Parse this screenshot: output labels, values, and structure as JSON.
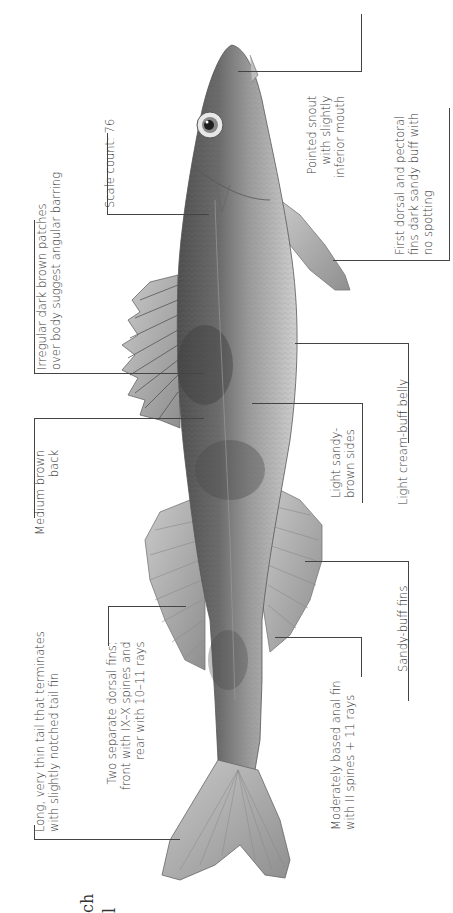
{
  "figure": {
    "orientation": "rotated 90 degrees counter-clockwise",
    "title_fragment": [
      "ch",
      "l"
    ]
  },
  "labels": {
    "tail": [
      "Long, very thin tail that terminates",
      "with slightly notched tail fin"
    ],
    "dorsal_fins": [
      "Two separate dorsal fins;",
      "front with IX–X spines and",
      "rear with 10–11 rays"
    ],
    "back": [
      "Medium brown",
      "back"
    ],
    "patches": [
      "Irregular dark brown patches",
      "over body suggest angular barring"
    ],
    "scale_count": [
      "Scale count: 76"
    ],
    "snout": [
      "Pointed snout",
      "with slightly",
      "inferior mouth"
    ],
    "pectoral": [
      "First dorsal and pectoral",
      "fins dark sandy buff with",
      "no spotting"
    ],
    "belly": [
      "Light cream-buff belly"
    ],
    "sides": [
      "Light sandy-",
      "brown sides"
    ],
    "sandy_fins": [
      "Sandy-buff fins"
    ],
    "anal_fin": [
      "Moderately based anal fin",
      "with II spines + 11 rays"
    ]
  },
  "colors": {
    "body_dark": "#5a5a5a",
    "body_mid": "#8a8a8a",
    "belly": "#c8c8c8",
    "fin": "#a9a9a9",
    "leader": "#444444",
    "background": "#ffffff"
  }
}
